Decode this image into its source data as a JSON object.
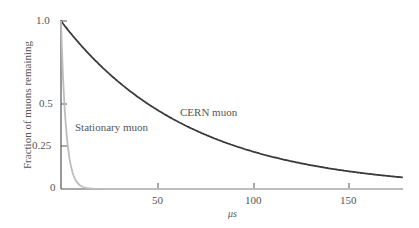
{
  "chart_data": {
    "type": "line",
    "title": "",
    "xlabel": "μs",
    "ylabel": "Fraction of muons remaining",
    "xlim": [
      0,
      177
    ],
    "ylim": [
      0,
      1.0
    ],
    "x_ticks": [
      "50",
      "100",
      "150"
    ],
    "y_ticks": [
      "0",
      "0.25",
      "0.5",
      "1.0"
    ],
    "grid": false,
    "legend": "inline annotations",
    "series": [
      {
        "name": "CERN muon",
        "color": "#3a3a3a",
        "model": "exp(-t/66.6)",
        "x": [
          0,
          25,
          50,
          75,
          100,
          125,
          150,
          177
        ],
        "y": [
          1.0,
          0.69,
          0.47,
          0.32,
          0.22,
          0.15,
          0.105,
          0.07
        ]
      },
      {
        "name": "Stationary muon",
        "color": "#bdbdbd",
        "model": "exp(-t/2.2)",
        "x": [
          0,
          2,
          5,
          10,
          15,
          20
        ],
        "y": [
          1.0,
          0.4,
          0.1,
          0.01,
          0.001,
          0.0
        ]
      }
    ],
    "annotations": [
      "CERN muon",
      "Stationary muon"
    ]
  },
  "labels": {
    "cern": "CERN muon",
    "stationary": "Stationary muon",
    "xlabel": "μs",
    "ylabel": "Fraction of muons remaining",
    "xt50": "50",
    "xt100": "100",
    "xt150": "150",
    "yt0": "0",
    "yt025": "0.25",
    "yt05": "0.5",
    "yt1": "1.0"
  }
}
